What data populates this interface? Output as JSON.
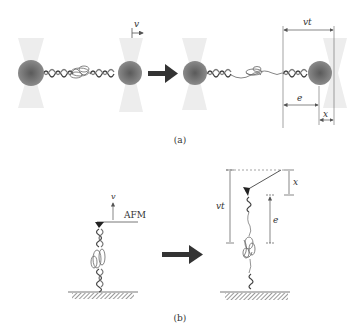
{
  "panel_a": {
    "caption": "(a)",
    "velocity_label": "v",
    "vt_label": "vt",
    "e_label": "e",
    "x_label": "x"
  },
  "panel_b": {
    "caption": "(b)",
    "velocity_label": "v",
    "afm_label": "AFM",
    "vt_label": "vt",
    "e_label": "e",
    "x_label": "x"
  },
  "colors": {
    "bead": "#6e6e6e",
    "bead_highlight": "#9a9a9a",
    "trap": "#ececec",
    "line": "#555555",
    "arrow": "#333333"
  }
}
